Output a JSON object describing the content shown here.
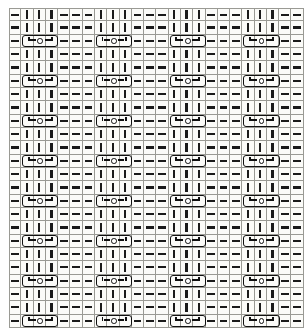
{
  "chart_data": {
    "type": "table",
    "xlabel": "Stitches",
    "ylabel": "Rows",
    "grid": true,
    "columns": 24,
    "rows": 24,
    "legend": [
      {
        "symbol": "|",
        "name": "knit-stitch",
        "label": "knit"
      },
      {
        "symbol": "—",
        "name": "purl-stitch",
        "label": "purl"
      },
      {
        "symbol": "cable",
        "name": "cable-cross-symbol",
        "label": "cable cross over 3 stitches with ring"
      }
    ],
    "colors": {
      "ink": "#1a1a1a",
      "gridline": "#9a9a94",
      "background": "#fbfbf8"
    },
    "column_repeat": [
      "purl",
      "knit",
      "knit",
      "knit",
      "purl",
      "purl"
    ],
    "row_repeat_period": 3,
    "cable_row_indices": [
      2,
      5,
      8,
      11,
      14,
      17,
      20,
      23
    ],
    "cable_column_starts": [
      1,
      7,
      13,
      19
    ],
    "cells": [
      [
        "purl",
        "knit",
        "knit",
        "knit",
        "purl",
        "purl",
        "purl",
        "knit",
        "knit",
        "knit",
        "purl",
        "purl",
        "purl",
        "knit",
        "knit",
        "knit",
        "purl",
        "purl",
        "purl",
        "knit",
        "knit",
        "knit",
        "purl",
        "purl"
      ],
      [
        "purl",
        "knit",
        "knit",
        "knit",
        "purl",
        "purl",
        "purl",
        "knit",
        "knit",
        "knit",
        "purl",
        "purl",
        "purl",
        "knit",
        "knit",
        "knit",
        "purl",
        "purl",
        "purl",
        "knit",
        "knit",
        "knit",
        "purl",
        "purl"
      ],
      [
        "purl",
        "cable",
        "cable",
        "cable",
        "purl",
        "purl",
        "purl",
        "cable",
        "cable",
        "cable",
        "purl",
        "purl",
        "purl",
        "cable",
        "cable",
        "cable",
        "purl",
        "purl",
        "purl",
        "cable",
        "cable",
        "cable",
        "purl",
        "purl"
      ],
      [
        "purl",
        "knit",
        "knit",
        "knit",
        "purl",
        "purl",
        "purl",
        "knit",
        "knit",
        "knit",
        "purl",
        "purl",
        "purl",
        "knit",
        "knit",
        "knit",
        "purl",
        "purl",
        "purl",
        "knit",
        "knit",
        "knit",
        "purl",
        "purl"
      ],
      [
        "purl",
        "knit",
        "knit",
        "knit",
        "purl",
        "purl",
        "purl",
        "knit",
        "knit",
        "knit",
        "purl",
        "purl",
        "purl",
        "knit",
        "knit",
        "knit",
        "purl",
        "purl",
        "purl",
        "knit",
        "knit",
        "knit",
        "purl",
        "purl"
      ],
      [
        "purl",
        "cable",
        "cable",
        "cable",
        "purl",
        "purl",
        "purl",
        "cable",
        "cable",
        "cable",
        "purl",
        "purl",
        "purl",
        "cable",
        "cable",
        "cable",
        "purl",
        "purl",
        "purl",
        "cable",
        "cable",
        "cable",
        "purl",
        "purl"
      ],
      [
        "purl",
        "knit",
        "knit",
        "knit",
        "purl",
        "purl",
        "purl",
        "knit",
        "knit",
        "knit",
        "purl",
        "purl",
        "purl",
        "knit",
        "knit",
        "knit",
        "purl",
        "purl",
        "purl",
        "knit",
        "knit",
        "knit",
        "purl",
        "purl"
      ],
      [
        "purl",
        "knit",
        "knit",
        "knit",
        "purl",
        "purl",
        "purl",
        "knit",
        "knit",
        "knit",
        "purl",
        "purl",
        "purl",
        "knit",
        "knit",
        "knit",
        "purl",
        "purl",
        "purl",
        "knit",
        "knit",
        "knit",
        "purl",
        "purl"
      ],
      [
        "purl",
        "cable",
        "cable",
        "cable",
        "purl",
        "purl",
        "purl",
        "cable",
        "cable",
        "cable",
        "purl",
        "purl",
        "purl",
        "cable",
        "cable",
        "cable",
        "purl",
        "purl",
        "purl",
        "cable",
        "cable",
        "cable",
        "purl",
        "purl"
      ],
      [
        "purl",
        "knit",
        "knit",
        "knit",
        "purl",
        "purl",
        "purl",
        "knit",
        "knit",
        "knit",
        "purl",
        "purl",
        "purl",
        "knit",
        "knit",
        "knit",
        "purl",
        "purl",
        "purl",
        "knit",
        "knit",
        "knit",
        "purl",
        "purl"
      ],
      [
        "purl",
        "knit",
        "knit",
        "knit",
        "purl",
        "purl",
        "purl",
        "knit",
        "knit",
        "knit",
        "purl",
        "purl",
        "purl",
        "knit",
        "knit",
        "knit",
        "purl",
        "purl",
        "purl",
        "knit",
        "knit",
        "knit",
        "purl",
        "purl"
      ],
      [
        "purl",
        "cable",
        "cable",
        "cable",
        "purl",
        "purl",
        "purl",
        "cable",
        "cable",
        "cable",
        "purl",
        "purl",
        "purl",
        "cable",
        "cable",
        "cable",
        "purl",
        "purl",
        "purl",
        "cable",
        "cable",
        "cable",
        "purl",
        "purl"
      ],
      [
        "purl",
        "knit",
        "knit",
        "knit",
        "purl",
        "purl",
        "purl",
        "knit",
        "knit",
        "knit",
        "purl",
        "purl",
        "purl",
        "knit",
        "knit",
        "knit",
        "purl",
        "purl",
        "purl",
        "knit",
        "knit",
        "knit",
        "purl",
        "purl"
      ],
      [
        "purl",
        "knit",
        "knit",
        "knit",
        "purl",
        "purl",
        "purl",
        "knit",
        "knit",
        "knit",
        "purl",
        "purl",
        "purl",
        "knit",
        "knit",
        "knit",
        "purl",
        "purl",
        "purl",
        "knit",
        "knit",
        "knit",
        "purl",
        "purl"
      ],
      [
        "purl",
        "cable",
        "cable",
        "cable",
        "purl",
        "purl",
        "purl",
        "cable",
        "cable",
        "cable",
        "purl",
        "purl",
        "purl",
        "cable",
        "cable",
        "cable",
        "purl",
        "purl",
        "purl",
        "cable",
        "cable",
        "cable",
        "purl",
        "purl"
      ],
      [
        "purl",
        "knit",
        "knit",
        "knit",
        "purl",
        "purl",
        "purl",
        "knit",
        "knit",
        "knit",
        "purl",
        "purl",
        "purl",
        "knit",
        "knit",
        "knit",
        "purl",
        "purl",
        "purl",
        "knit",
        "knit",
        "knit",
        "purl",
        "purl"
      ],
      [
        "purl",
        "knit",
        "knit",
        "knit",
        "purl",
        "purl",
        "purl",
        "knit",
        "knit",
        "knit",
        "purl",
        "purl",
        "purl",
        "knit",
        "knit",
        "knit",
        "purl",
        "purl",
        "purl",
        "knit",
        "knit",
        "knit",
        "purl",
        "purl"
      ],
      [
        "purl",
        "cable",
        "cable",
        "cable",
        "purl",
        "purl",
        "purl",
        "cable",
        "cable",
        "cable",
        "purl",
        "purl",
        "purl",
        "cable",
        "cable",
        "cable",
        "purl",
        "purl",
        "purl",
        "cable",
        "cable",
        "cable",
        "purl",
        "purl"
      ],
      [
        "purl",
        "knit",
        "knit",
        "knit",
        "purl",
        "purl",
        "purl",
        "knit",
        "knit",
        "knit",
        "purl",
        "purl",
        "purl",
        "knit",
        "knit",
        "knit",
        "purl",
        "purl",
        "purl",
        "knit",
        "knit",
        "knit",
        "purl",
        "purl"
      ],
      [
        "purl",
        "knit",
        "knit",
        "knit",
        "purl",
        "purl",
        "purl",
        "knit",
        "knit",
        "knit",
        "purl",
        "purl",
        "purl",
        "knit",
        "knit",
        "knit",
        "purl",
        "purl",
        "purl",
        "knit",
        "knit",
        "knit",
        "purl",
        "purl"
      ],
      [
        "purl",
        "cable",
        "cable",
        "cable",
        "purl",
        "purl",
        "purl",
        "cable",
        "cable",
        "cable",
        "purl",
        "purl",
        "purl",
        "cable",
        "cable",
        "cable",
        "purl",
        "purl",
        "purl",
        "cable",
        "cable",
        "cable",
        "purl",
        "purl"
      ],
      [
        "purl",
        "knit",
        "knit",
        "knit",
        "purl",
        "purl",
        "purl",
        "knit",
        "knit",
        "knit",
        "purl",
        "purl",
        "purl",
        "knit",
        "knit",
        "knit",
        "purl",
        "purl",
        "purl",
        "knit",
        "knit",
        "knit",
        "purl",
        "purl"
      ],
      [
        "purl",
        "knit",
        "knit",
        "knit",
        "purl",
        "purl",
        "purl",
        "knit",
        "knit",
        "knit",
        "purl",
        "purl",
        "purl",
        "knit",
        "knit",
        "knit",
        "purl",
        "purl",
        "purl",
        "knit",
        "knit",
        "knit",
        "purl",
        "purl"
      ],
      [
        "purl",
        "cable",
        "cable",
        "cable",
        "purl",
        "purl",
        "purl",
        "cable",
        "cable",
        "cable",
        "purl",
        "purl",
        "purl",
        "cable",
        "cable",
        "cable",
        "purl",
        "purl",
        "purl",
        "cable",
        "cable",
        "cable",
        "purl",
        "purl"
      ]
    ]
  }
}
